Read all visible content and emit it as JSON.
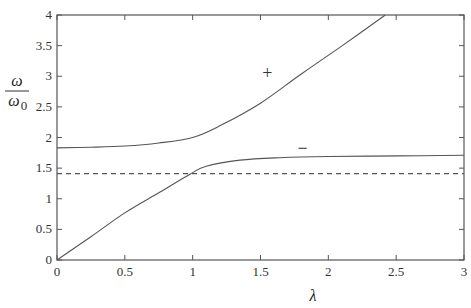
{
  "chart_data": {
    "type": "line",
    "title": "",
    "xlabel": "λ",
    "ylabel": "ω / ω0",
    "ylabel_parts": {
      "numerator": "ω",
      "denominator": "ω",
      "subscript": "0"
    },
    "xlim": [
      0,
      3
    ],
    "ylim": [
      0,
      4
    ],
    "grid": false,
    "legend": "none",
    "x_ticks": [
      0,
      0.5,
      1,
      1.5,
      2,
      2.5,
      3
    ],
    "x_tick_labels": [
      "0",
      "0.5",
      "1",
      "1.5",
      "2",
      "2.5",
      "3"
    ],
    "y_ticks": [
      0,
      0.5,
      1,
      1.5,
      2,
      2.5,
      3,
      3.5,
      4
    ],
    "y_tick_labels": [
      "0",
      "0.5",
      "1",
      "1.5",
      "2",
      "2.5",
      "3",
      "3.5",
      "4"
    ],
    "series": [
      {
        "name": "+",
        "style": "solid",
        "x": [
          0,
          0.25,
          0.5,
          0.75,
          1.0,
          1.2,
          1.5,
          1.79,
          2.09,
          2.42
        ],
        "y": [
          1.83,
          1.84,
          1.86,
          1.91,
          2.0,
          2.19,
          2.56,
          3.02,
          3.48,
          4.0
        ]
      },
      {
        "name": "−",
        "style": "solid",
        "x": [
          0,
          0.25,
          0.5,
          0.76,
          0.98,
          1.1,
          1.35,
          1.64,
          2.0,
          2.53,
          3.0
        ],
        "y": [
          0,
          0.38,
          0.77,
          1.11,
          1.4,
          1.53,
          1.63,
          1.67,
          1.69,
          1.7,
          1.71
        ]
      },
      {
        "name": "asymptote",
        "style": "dashed",
        "x": [
          0,
          3
        ],
        "y": [
          1.41,
          1.41
        ]
      }
    ],
    "annotations": [
      {
        "text": "+",
        "x": 1.55,
        "y": 3.05
      },
      {
        "text": "−",
        "x": 1.81,
        "y": 1.83
      }
    ]
  }
}
